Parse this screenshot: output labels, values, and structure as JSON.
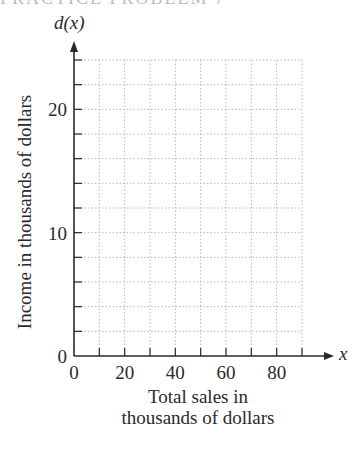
{
  "header": {
    "clipped_text": "PRACTICE PROBLEM 7"
  },
  "chart_data": {
    "type": "line",
    "title": "",
    "function_label": "d(x)",
    "x_variable": "x",
    "xlabel": "Total sales in thousands of dollars",
    "xlabel_lines": [
      "Total sales in",
      "thousands of dollars"
    ],
    "ylabel": "Income in thousands of dollars",
    "xlim": [
      0,
      90
    ],
    "ylim": [
      0,
      24
    ],
    "x_ticks": [
      0,
      10,
      20,
      30,
      40,
      50,
      60,
      70,
      80,
      90
    ],
    "x_tick_labels": [
      "0",
      "20",
      "40",
      "60",
      "80"
    ],
    "x_tick_label_values": [
      0,
      20,
      40,
      60,
      80
    ],
    "y_ticks": [
      0,
      2,
      4,
      6,
      8,
      10,
      12,
      14,
      16,
      18,
      20,
      22,
      24
    ],
    "y_tick_labels": [
      "0",
      "10",
      "20"
    ],
    "y_tick_label_values": [
      0,
      10,
      20
    ],
    "grid": true,
    "grid_style": "dotted",
    "series": [],
    "colors": {
      "axis": "#2a2a2a",
      "grid": "#b8b8b8",
      "text": "#2a2a2a"
    }
  }
}
